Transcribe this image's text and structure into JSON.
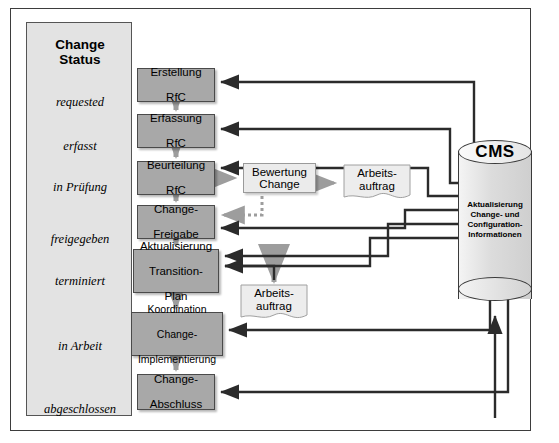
{
  "diagram": {
    "status_column": {
      "title_line1": "Change",
      "title_line2": "Status",
      "items": [
        {
          "label": "requested",
          "y": 82
        },
        {
          "label": "erfasst",
          "y": 126
        },
        {
          "label": "in Prüfung",
          "y": 167
        },
        {
          "label": "freigegeben",
          "y": 219
        },
        {
          "label": "terminiert",
          "y": 261
        },
        {
          "label": "in Arbeit",
          "y": 326
        },
        {
          "label": "abgeschlossen",
          "y": 389
        }
      ]
    },
    "process_steps": [
      {
        "id": "erstellung-rfc",
        "line1": "Erstellung",
        "line2": "RfC",
        "line3": "",
        "x": 137,
        "y": 68,
        "w": 78,
        "h": 34
      },
      {
        "id": "erfassung-rfc",
        "line1": "Erfassung",
        "line2": "RfC",
        "line3": "",
        "x": 137,
        "y": 114,
        "w": 78,
        "h": 34
      },
      {
        "id": "beurteilung-rfc",
        "line1": "Beurteilung",
        "line2": "RfC",
        "line3": "",
        "x": 137,
        "y": 161,
        "w": 78,
        "h": 34
      },
      {
        "id": "change-freigabe",
        "line1": "Change-",
        "line2": "Freigabe",
        "line3": "",
        "x": 137,
        "y": 205,
        "w": 78,
        "h": 34
      },
      {
        "id": "transition-plan",
        "line1": "Aktualisierung",
        "line2": "Transition-",
        "line3": "Plan",
        "x": 133,
        "y": 249,
        "w": 86,
        "h": 44
      },
      {
        "id": "koordination",
        "line1": "Koordination",
        "line2": "Change-",
        "line3": "Implementierung",
        "x": 131,
        "y": 312,
        "w": 92,
        "h": 44
      },
      {
        "id": "change-abschluss",
        "line1": "Change-",
        "line2": "Abschluss",
        "line3": "",
        "x": 137,
        "y": 374,
        "w": 78,
        "h": 36
      }
    ],
    "secondary_boxes": [
      {
        "id": "bewertung-change",
        "line1": "Bewertung",
        "line2": "Change",
        "x": 243,
        "y": 163,
        "w": 73,
        "h": 30
      }
    ],
    "documents": [
      {
        "id": "arbeitsauftrag-1",
        "line1": "Arbeits-",
        "line2": "auftrag",
        "x": 343,
        "y": 166,
        "w": 68,
        "h": 34
      },
      {
        "id": "arbeitsauftrag-2",
        "line1": "Arbeits-",
        "line2": "auftrag",
        "x": 240,
        "y": 286,
        "w": 68,
        "h": 34
      }
    ],
    "database": {
      "title": "CMS",
      "caption_line1": "Aktualisierung",
      "caption_line2": "Change- und",
      "caption_line3": "Configuration-",
      "caption_line4": "Informationen"
    },
    "colors": {
      "process_fill": "#a8a8a8",
      "status_fill": "#e3e3e3",
      "secondary_fill": "#ebebeb",
      "stroke": "#2b2b2b",
      "dotted_arrow": "#9d9d9d",
      "flow_arrow": "#9d9d9d"
    }
  }
}
